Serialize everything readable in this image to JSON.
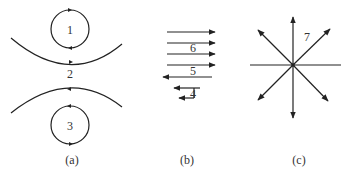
{
  "figure": {
    "panels": [
      {
        "id": "a",
        "caption": "(a)",
        "description": "Two counter-rotating vortices separated by two curved streamlines",
        "labels": {
          "top_vortex": "1",
          "gap": "2",
          "bottom_vortex": "3"
        }
      },
      {
        "id": "b",
        "caption": "(b)",
        "description": "Horizontal arrows: four rightward, one long leftward, two short leftward with connector",
        "labels": {
          "upper": "6",
          "middle": "5",
          "lower": "4"
        }
      },
      {
        "id": "c",
        "caption": "(c)",
        "description": "Radial arrows diverging from a center point with horizontal line",
        "labels": {
          "radial": "7"
        }
      }
    ],
    "stroke_color": "#222222",
    "background": "#ffffff"
  }
}
